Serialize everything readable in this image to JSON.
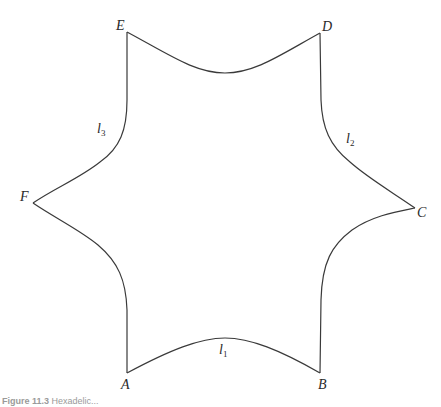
{
  "figure": {
    "type": "curved hexagon (hexagram-like region)",
    "stroke_color": "#3a3a3a",
    "background": "#ffffff",
    "vertices": [
      {
        "name": "A",
        "x": 127,
        "y": 373
      },
      {
        "name": "B",
        "x": 320,
        "y": 373
      },
      {
        "name": "C",
        "x": 415,
        "y": 208
      },
      {
        "name": "D",
        "x": 320,
        "y": 33
      },
      {
        "name": "E",
        "x": 127,
        "y": 32
      },
      {
        "name": "F",
        "x": 33,
        "y": 203
      }
    ],
    "vertex_labels": {
      "A": "A",
      "B": "B",
      "C": "C",
      "D": "D",
      "E": "E",
      "F": "F"
    },
    "edge_labels": [
      {
        "base": "l",
        "sub": "1",
        "edge": "AB"
      },
      {
        "base": "l",
        "sub": "2",
        "edge": "DC"
      },
      {
        "base": "l",
        "sub": "3",
        "edge": "EF"
      }
    ]
  },
  "caption": {
    "label": "Figure 11.3",
    "text": "Hexadelic..."
  }
}
